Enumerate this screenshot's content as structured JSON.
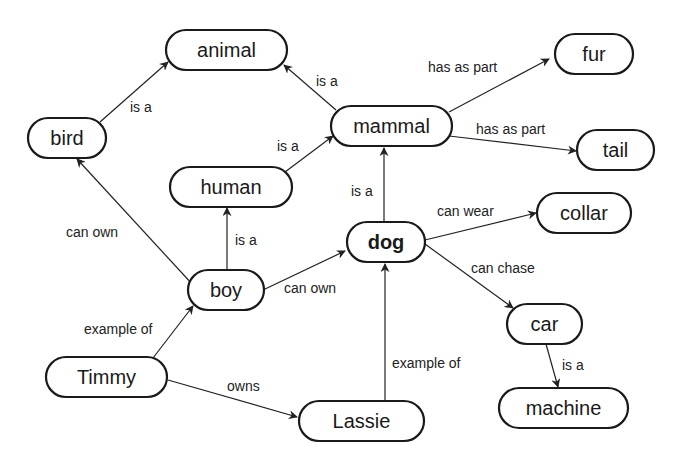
{
  "diagram": {
    "type": "semantic network / concept map",
    "nodes": [
      {
        "id": "animal",
        "label": "animal",
        "bold": false,
        "x": 166,
        "y": 30,
        "w": 121,
        "h": 40
      },
      {
        "id": "fur",
        "label": "fur",
        "bold": false,
        "x": 555,
        "y": 34,
        "w": 78,
        "h": 40
      },
      {
        "id": "bird",
        "label": "bird",
        "bold": false,
        "x": 28,
        "y": 118,
        "w": 78,
        "h": 40
      },
      {
        "id": "mammal",
        "label": "mammal",
        "bold": false,
        "x": 331,
        "y": 106,
        "w": 121,
        "h": 40
      },
      {
        "id": "tail",
        "label": "tail",
        "bold": false,
        "x": 577,
        "y": 130,
        "w": 77,
        "h": 40
      },
      {
        "id": "human",
        "label": "human",
        "bold": false,
        "x": 170,
        "y": 167,
        "w": 122,
        "h": 40
      },
      {
        "id": "collar",
        "label": "collar",
        "bold": false,
        "x": 537,
        "y": 193,
        "w": 94,
        "h": 40
      },
      {
        "id": "dog",
        "label": "dog",
        "bold": true,
        "x": 347,
        "y": 222,
        "w": 78,
        "h": 40
      },
      {
        "id": "boy",
        "label": "boy",
        "bold": false,
        "x": 188,
        "y": 270,
        "w": 76,
        "h": 40
      },
      {
        "id": "car",
        "label": "car",
        "bold": false,
        "x": 507,
        "y": 304,
        "w": 75,
        "h": 40
      },
      {
        "id": "timmy",
        "label": "Timmy",
        "bold": false,
        "x": 46,
        "y": 357,
        "w": 121,
        "h": 40
      },
      {
        "id": "lassie",
        "label": "Lassie",
        "bold": false,
        "x": 299,
        "y": 401,
        "w": 125,
        "h": 40
      },
      {
        "id": "machine",
        "label": "machine",
        "bold": false,
        "x": 499,
        "y": 388,
        "w": 129,
        "h": 40
      }
    ],
    "edges": [
      {
        "from": "bird",
        "to": "animal",
        "label": "is a",
        "x1": 100,
        "y1": 122,
        "x2": 168,
        "y2": 62,
        "lx": 130,
        "ly": 112
      },
      {
        "from": "mammal",
        "to": "animal",
        "label": "is a",
        "x1": 336,
        "y1": 110,
        "x2": 284,
        "y2": 65,
        "lx": 316,
        "ly": 86
      },
      {
        "from": "human",
        "to": "mammal",
        "label": "is a",
        "x1": 285,
        "y1": 172,
        "x2": 333,
        "y2": 136,
        "lx": 277,
        "ly": 151
      },
      {
        "from": "mammal",
        "to": "fur",
        "label": "has as part",
        "x1": 449,
        "y1": 112,
        "x2": 549,
        "y2": 59,
        "lx": 428,
        "ly": 72
      },
      {
        "from": "mammal",
        "to": "tail",
        "label": "has as part",
        "x1": 449,
        "y1": 136,
        "x2": 576,
        "y2": 151,
        "lx": 476,
        "ly": 134
      },
      {
        "from": "dog",
        "to": "mammal",
        "label": "is a",
        "x1": 384,
        "y1": 222,
        "x2": 384,
        "y2": 148,
        "lx": 351,
        "ly": 196
      },
      {
        "from": "boy",
        "to": "human",
        "label": "is a",
        "x1": 227,
        "y1": 270,
        "x2": 227,
        "y2": 208,
        "lx": 235,
        "ly": 245
      },
      {
        "from": "boy",
        "to": "bird",
        "label": "can own",
        "x1": 193,
        "y1": 285,
        "x2": 77,
        "y2": 159,
        "lx": 66,
        "ly": 237
      },
      {
        "from": "boy",
        "to": "dog",
        "label": "can own",
        "x1": 263,
        "y1": 290,
        "x2": 345,
        "y2": 251,
        "lx": 284,
        "ly": 293
      },
      {
        "from": "dog",
        "to": "collar",
        "label": "can wear",
        "x1": 425,
        "y1": 240,
        "x2": 536,
        "y2": 213,
        "lx": 437,
        "ly": 216
      },
      {
        "from": "dog",
        "to": "car",
        "label": "can chase",
        "x1": 425,
        "y1": 244,
        "x2": 513,
        "y2": 308,
        "lx": 471,
        "ly": 273
      },
      {
        "from": "car",
        "to": "machine",
        "label": "is a",
        "x1": 546,
        "y1": 344,
        "x2": 558,
        "y2": 387,
        "lx": 562,
        "ly": 370
      },
      {
        "from": "timmy",
        "to": "boy",
        "label": "example of",
        "x1": 153,
        "y1": 358,
        "x2": 193,
        "y2": 306,
        "lx": 84,
        "ly": 334
      },
      {
        "from": "timmy",
        "to": "lassie",
        "label": "owns",
        "x1": 168,
        "y1": 380,
        "x2": 297,
        "y2": 417,
        "lx": 227,
        "ly": 391
      },
      {
        "from": "lassie",
        "to": "dog",
        "label": "example of",
        "x1": 385,
        "y1": 401,
        "x2": 385,
        "y2": 264,
        "lx": 392,
        "ly": 368
      }
    ]
  }
}
